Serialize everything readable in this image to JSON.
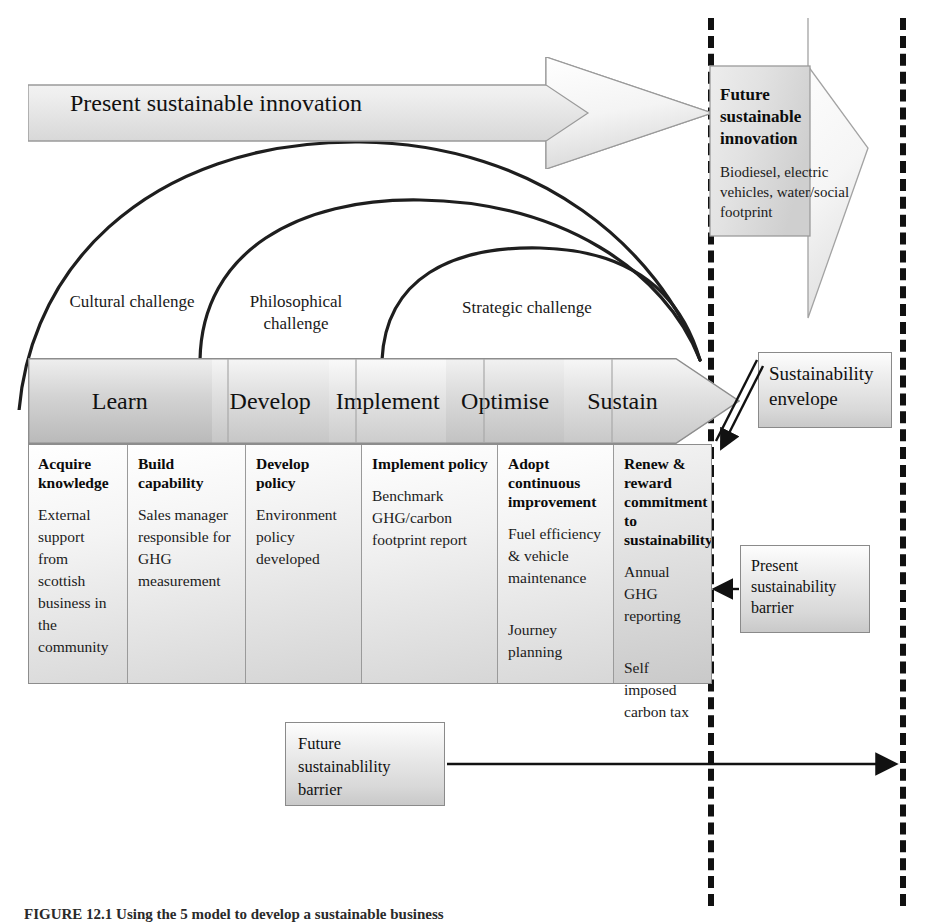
{
  "figure": {
    "caption": "FIGURE 12.1  Using the 5 model to develop a sustainable business"
  },
  "top_arrow": {
    "label": "Present sustainable innovation"
  },
  "future_innovation": {
    "title": "Future sustainable innovation",
    "body": "Biodiesel, electric vehicles, water/social footprint"
  },
  "arcs": [
    {
      "id": "cultural",
      "label": "Cultural challenge"
    },
    {
      "id": "philosophical",
      "label": "Philosophical challenge"
    },
    {
      "id": "strategic",
      "label": "Strategic challenge"
    }
  ],
  "process": {
    "stages": [
      {
        "label": "Learn"
      },
      {
        "label": "Develop"
      },
      {
        "label": "Implement"
      },
      {
        "label": "Optimise"
      },
      {
        "label": "Sustain"
      }
    ]
  },
  "details": [
    {
      "heading": "Acquire knowledge",
      "body": "External support from scottish business in the community",
      "body2": ""
    },
    {
      "heading": "Build capability",
      "body": "Sales manager responsible for GHG measurement",
      "body2": ""
    },
    {
      "heading": "Develop policy",
      "body": "Environment policy developed",
      "body2": ""
    },
    {
      "heading": "Implement policy",
      "body": "Benchmark GHG/carbon footprint report",
      "body2": ""
    },
    {
      "heading": "Adopt continuous improvement",
      "body": "Fuel efficiency & vehicle maintenance",
      "body2": "Journey planning"
    },
    {
      "heading": "Renew & reward commitment to sustainability",
      "body": "Annual GHG reporting",
      "body2": "Self imposed carbon tax"
    }
  ],
  "callouts": {
    "sustainability_envelope": "Sustainability envelope",
    "present_barrier": "Present sustainability barrier",
    "future_barrier": "Future sustainablility barrier"
  },
  "barriers": {
    "present_line": "present-sustainability-barrier-line",
    "future_line": "future-sustainability-barrier-line"
  },
  "colors": {
    "ink": "#111111",
    "line": "#333333",
    "fill_light": "#f2f2f2",
    "fill_mid": "#d8d8d8",
    "fill_dark": "#b9b9b9"
  }
}
